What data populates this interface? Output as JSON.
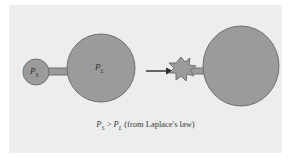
{
  "figure": {
    "name": "alveolar-collapse-laplace-diagram",
    "panel_background": "#eceded",
    "page_background": "#ffffff",
    "shape_fill": "#9b9b9b",
    "shape_stroke": "#6f6f6f",
    "arrow_color": "#2b2b2b",
    "text_color": "#3a3a3a"
  },
  "labels": {
    "small_alveolus": {
      "symbol": "P",
      "subscript": "S",
      "icon": "small-alveolus-circle"
    },
    "large_alveolus": {
      "symbol": "P",
      "subscript": "L",
      "icon": "large-alveolus-circle"
    }
  },
  "caption": {
    "lhs_symbol": "P",
    "lhs_subscript": "S",
    "operator": " > ",
    "rhs_symbol": "P",
    "rhs_subscript": "L",
    "note": " (from Laplace's law)",
    "full_text": "PS > PL (from Laplace's law)"
  },
  "elements": {
    "arrow": {
      "icon": "right-arrow-icon",
      "direction": "right"
    },
    "collapsed_alveolus": {
      "icon": "collapsed-alveolus-star-icon"
    },
    "enlarged_alveolus": {
      "icon": "enlarged-alveolus-blob-icon"
    },
    "connecting_duct_left": {
      "icon": "duct-icon"
    },
    "connecting_duct_right": {
      "icon": "duct-icon"
    }
  }
}
